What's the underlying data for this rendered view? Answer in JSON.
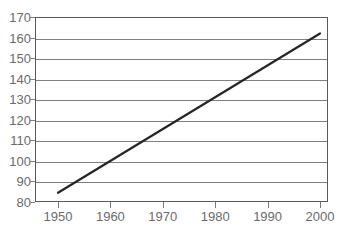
{
  "chart_data": {
    "type": "line",
    "title": "",
    "subtitle": "",
    "xlabel": "",
    "ylabel": "",
    "xlim": [
      1945,
      2005
    ],
    "ylim": [
      80,
      170
    ],
    "grid": true,
    "legend": false,
    "legend_position": "none",
    "x_ticks": [
      1950,
      1960,
      1970,
      1980,
      1990,
      2000
    ],
    "x_tick_labels": [
      "1950",
      "1960",
      "1970",
      "1980",
      "1990",
      "2000"
    ],
    "y_ticks": [
      80,
      90,
      100,
      110,
      120,
      130,
      140,
      150,
      160,
      170
    ],
    "y_tick_labels": [
      "80",
      "90",
      "100",
      "110",
      "120",
      "130",
      "140",
      "150",
      "160",
      "170"
    ],
    "series": [
      {
        "name": "trend",
        "x": [
          1950,
          2000
        ],
        "values": [
          84.5,
          162.0
        ]
      }
    ],
    "annotations": []
  },
  "style": {
    "line_color": "#262626",
    "grid_color": "#808080",
    "frame_color": "#595959",
    "tick_color": "#7a7a7a",
    "label_color": "#6b6b6b",
    "plot_background": "#ffffff",
    "page_background": "#ffffff"
  }
}
